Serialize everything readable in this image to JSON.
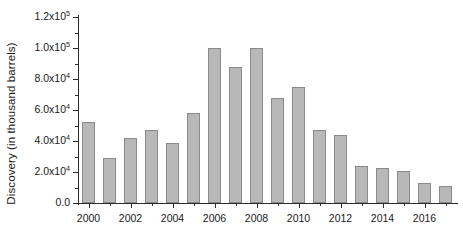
{
  "chart_data": {
    "type": "bar",
    "title": "",
    "xlabel": "",
    "ylabel": "Discovery (in thousand barrels)",
    "categories": [
      "2000",
      "2001",
      "2002",
      "2003",
      "2004",
      "2005",
      "2006",
      "2007",
      "2008",
      "2009",
      "2010",
      "2011",
      "2012",
      "2013",
      "2014",
      "2015",
      "2016",
      "2017"
    ],
    "values": [
      52000,
      29000,
      42000,
      47000,
      38500,
      58000,
      100000,
      87500,
      100000,
      68000,
      75000,
      47000,
      44000,
      24000,
      22500,
      20500,
      13000,
      11000
    ],
    "ylim": [
      0,
      120000
    ],
    "xlim": [
      "2000",
      "2017"
    ],
    "grid": false,
    "legend": false,
    "series_color": "#b8b8b8",
    "series_edge_color": "#8a8a8a",
    "axis_color": "#2b2b2b",
    "background_color": "#ffffff",
    "y_ticks": [
      {
        "value": 0,
        "label_mantissa": "0.0",
        "label_exp": ""
      },
      {
        "value": 20000,
        "label_mantissa": "2.0x10",
        "label_exp": "4"
      },
      {
        "value": 40000,
        "label_mantissa": "4.0x10",
        "label_exp": "4"
      },
      {
        "value": 60000,
        "label_mantissa": "6.0x10",
        "label_exp": "4"
      },
      {
        "value": 80000,
        "label_mantissa": "8.0x10",
        "label_exp": "4"
      },
      {
        "value": 100000,
        "label_mantissa": "1.0x10",
        "label_exp": "5"
      },
      {
        "value": 120000,
        "label_mantissa": "1.2x10",
        "label_exp": "5"
      }
    ],
    "y_minor_ticks": [
      10000,
      30000,
      50000,
      70000,
      90000,
      110000
    ],
    "x_tick_labels": [
      "2000",
      "2002",
      "2004",
      "2006",
      "2008",
      "2010",
      "2012",
      "2014",
      "2016"
    ]
  }
}
